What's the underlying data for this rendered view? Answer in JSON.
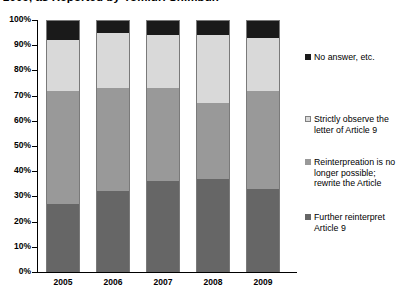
{
  "chart_data": {
    "type": "bar",
    "subtype": "stacked-100-percent",
    "title": "2009, as Reported by Yomiuri Shimbun",
    "xlabel": "",
    "ylabel": "",
    "ylim": [
      0,
      100
    ],
    "ytick_labels": [
      "100%",
      "90%",
      "80%",
      "70%",
      "60%",
      "50%",
      "40%",
      "30%",
      "20%",
      "10%",
      "0%"
    ],
    "ytick_values": [
      100,
      90,
      80,
      70,
      60,
      50,
      40,
      30,
      20,
      10,
      0
    ],
    "grid": false,
    "legend_position": "right",
    "categories": [
      "2005",
      "2006",
      "2007",
      "2008",
      "2009"
    ],
    "series": [
      {
        "name": "Further reinterpret Article 9",
        "color": "#666666",
        "values": [
          27,
          32,
          36,
          37,
          33
        ]
      },
      {
        "name": "Reinterpreation is no longer possible; rewrite the Article",
        "color": "#999999",
        "values": [
          45,
          41,
          37,
          30,
          39
        ]
      },
      {
        "name": "Strictly observe the letter of  Article 9",
        "color": "#d9d9d9",
        "values": [
          20,
          22,
          21,
          27,
          21
        ]
      },
      {
        "name": "No answer,  etc.",
        "color": "#1a1a1a",
        "values": [
          8,
          5,
          6,
          6,
          7
        ]
      }
    ]
  },
  "legend": {
    "entries": [
      {
        "label": "No answer,  etc.",
        "color": "#1a1a1a",
        "top": 0
      },
      {
        "label": "Strictly observe the letter of  Article 9",
        "color": "#d9d9d9",
        "top": 62
      },
      {
        "label": "Reinterpreation is no longer possible; rewrite the Article",
        "color": "#999999",
        "top": 105
      },
      {
        "label": "Further reinterpret Article 9",
        "color": "#666666",
        "top": 160
      }
    ]
  }
}
